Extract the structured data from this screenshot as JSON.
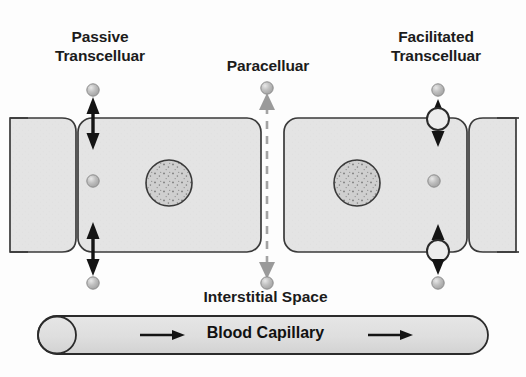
{
  "diagram": {
    "background_color": "#fdfdfd",
    "labels": {
      "passive_transcellular": "Passive\nTranscelluar",
      "paracellular": "Paracelluar",
      "facilitated_transcellular": "Facilitated\nTranscelluar",
      "interstitial_space": "Interstitial Space",
      "blood_capillary": "Blood Capillary"
    },
    "colors": {
      "cell_fill": "#e3e3e3",
      "cell_stroke": "#3a3a3a",
      "nucleus_fill": "#cfcfcf",
      "nucleus_stroke": "#3a3a3a",
      "molecule_fill": "#b5b5b5",
      "molecule_stroke": "#8a8a8a",
      "transporter_fill": "#ececec",
      "transporter_stroke": "#2b2b2b",
      "arrow_black": "#141414",
      "arrow_gray": "#9a9a9a",
      "capillary_fill": "#e0e0e0",
      "capillary_stroke": "#2b2b2b",
      "text": "#1b1b1b"
    },
    "routes": [
      {
        "name": "passive-transcellular",
        "label": "Passive\nTranscelluar",
        "arrow_color": "#141414",
        "arrow_style": "double-headed-solid",
        "has_transporter": false,
        "x": 93
      },
      {
        "name": "paracellular",
        "label": "Paracelluar",
        "arrow_color": "#9a9a9a",
        "arrow_style": "dashed-double-headed",
        "has_transporter": false,
        "x": 267
      },
      {
        "name": "facilitated-transcellular",
        "label": "Facilitated\nTranscelluar",
        "arrow_color": "#141414",
        "arrow_style": "double-headed-solid-with-carrier",
        "has_transporter": true,
        "x": 438
      }
    ],
    "cells": [
      {
        "name": "cell-left-partial",
        "x": 28,
        "y": 118,
        "w": 48,
        "h": 134
      },
      {
        "name": "cell-left-main",
        "x": 76,
        "y": 118,
        "w": 185,
        "h": 134
      },
      {
        "name": "cell-right-main",
        "x": 284,
        "y": 118,
        "w": 185,
        "h": 134
      },
      {
        "name": "cell-right-partial",
        "x": 469,
        "y": 118,
        "w": 47,
        "h": 134
      }
    ],
    "nuclei": [
      {
        "name": "nucleus-left",
        "cx": 169,
        "cy": 183,
        "r": 23
      },
      {
        "name": "nucleus-right",
        "cx": 357,
        "cy": 183,
        "r": 23
      }
    ],
    "molecules": [
      {
        "name": "molecule-passive-apical",
        "cx": 93,
        "cy": 90,
        "r": 6
      },
      {
        "name": "molecule-passive-intracellular",
        "cx": 93,
        "cy": 181,
        "r": 6
      },
      {
        "name": "molecule-passive-basal",
        "cx": 93,
        "cy": 283,
        "r": 6
      },
      {
        "name": "molecule-paracellular-apical",
        "cx": 267,
        "cy": 88,
        "r": 6
      },
      {
        "name": "molecule-paracellular-basal",
        "cx": 267,
        "cy": 283,
        "r": 6
      },
      {
        "name": "molecule-facilitated-apical",
        "cx": 438,
        "cy": 90,
        "r": 6
      },
      {
        "name": "molecule-facilitated-intracellular",
        "cx": 434,
        "cy": 181,
        "r": 6
      },
      {
        "name": "molecule-facilitated-basal",
        "cx": 438,
        "cy": 283,
        "r": 6
      }
    ],
    "transporters": [
      {
        "name": "transporter-apical",
        "cx": 438,
        "cy": 119,
        "r": 11
      },
      {
        "name": "transporter-basal",
        "cx": 438,
        "cy": 251,
        "r": 11
      }
    ],
    "capillary": {
      "name": "blood-capillary",
      "x": 38,
      "y": 316,
      "w": 450,
      "h": 38,
      "flow_arrows": 2,
      "flow_direction": "left-to-right"
    }
  }
}
